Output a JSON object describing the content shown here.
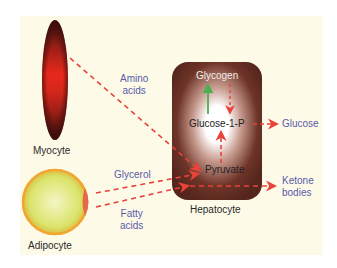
{
  "diagram": {
    "colors": {
      "background_panel": "#fdfbe8",
      "arrow": "#e8423a",
      "synthesis_arrow": "#4caf50",
      "metabolite_text": "#5a5aa8",
      "cell_label_text": "#2a2a2a",
      "hepatocyte_fill": "#5a2a20",
      "myocyte_fill": "#e22a1e",
      "adipocyte_fill": "#e6ec8a",
      "adipocyte_rim": "#f2a530"
    },
    "cells": {
      "myocyte": {
        "label": "Myocyte"
      },
      "adipocyte": {
        "label": "Adipocyte"
      },
      "hepatocyte": {
        "label": "Hepatocyte"
      }
    },
    "metabolites": {
      "glycogen": "Glycogen",
      "glucose_1_p": "Glucose-1-P",
      "pyruvate": "Pyruvate",
      "glucose": "Glucose",
      "ketone_bodies_line1": "Ketone",
      "ketone_bodies_line2": "bodies",
      "amino_acids_line1": "Amino",
      "amino_acids_line2": "acids",
      "glycerol": "Glycerol",
      "fatty_acids_line1": "Fatty",
      "fatty_acids_line2": "acids"
    },
    "arrows": [
      {
        "from": "Myocyte",
        "to": "Pyruvate",
        "label": "Amino acids",
        "style": "dashed"
      },
      {
        "from": "Adipocyte",
        "to": "Pyruvate",
        "label": "Glycerol",
        "style": "dashed"
      },
      {
        "from": "Adipocyte",
        "to": "Ketone bodies",
        "label": "Fatty acids",
        "style": "dashed"
      },
      {
        "from": "Pyruvate",
        "to": "Glucose-1-P",
        "style": "dashed"
      },
      {
        "from": "Glycogen",
        "to": "Glucose-1-P",
        "style": "dashed"
      },
      {
        "from": "Glucose-1-P",
        "to": "Glycogen",
        "style": "solid-green"
      },
      {
        "from": "Glucose-1-P",
        "to": "Glucose",
        "style": "dashed"
      }
    ]
  }
}
